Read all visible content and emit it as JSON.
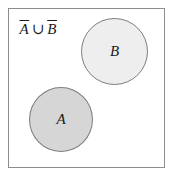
{
  "figure": {
    "name": "venn-diagram",
    "expression": {
      "full": "A̅ ∪ B̅",
      "left_operand": "A",
      "operator": "∪",
      "right_operand": "B",
      "left_operand_complement": true,
      "right_operand_complement": true
    },
    "universe": {
      "label": "",
      "border_color": "#8d8d8d",
      "fill_color": "#ffffff"
    },
    "sets": [
      {
        "id": "A",
        "label": "A",
        "fill_color": "#d6d6d6",
        "border_color": "#7d7d7d",
        "shaded": true
      },
      {
        "id": "B",
        "label": "B",
        "fill_color": "#eeeeee",
        "border_color": "#7d7d7d",
        "shaded": true
      }
    ]
  }
}
